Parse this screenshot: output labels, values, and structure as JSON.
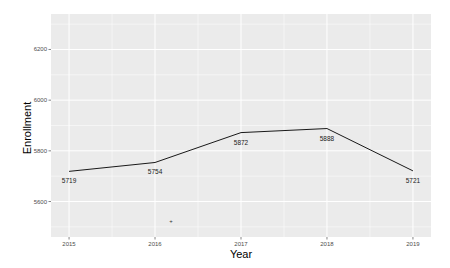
{
  "chart_data": {
    "type": "line",
    "title": "",
    "xlabel": "Year",
    "ylabel": "Enrollment",
    "x": [
      2015,
      2016,
      2017,
      2018,
      2019
    ],
    "values": [
      5719,
      5754,
      5872,
      5888,
      5721
    ],
    "data_labels": [
      "5719",
      "5754",
      "5872",
      "5888",
      "5721"
    ],
    "x_ticks": [
      "2015",
      "2016",
      "2017",
      "2018",
      "2019"
    ],
    "y_ticks": [
      "5600",
      "5800",
      "6000",
      "6200"
    ],
    "ylim": [
      5460,
      6340
    ],
    "xlim": [
      2014.79,
      2019.21
    ],
    "grid": true,
    "legend": null,
    "line_color": "#000000",
    "panel_background": "#ebebeb",
    "grid_color": "#ffffff"
  },
  "annotations": {
    "cursor_mark": "+"
  }
}
